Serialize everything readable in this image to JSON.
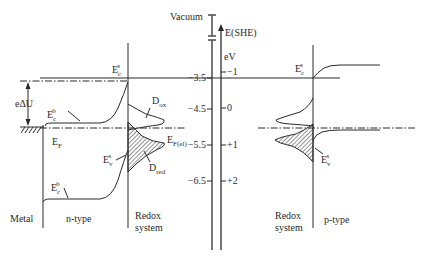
{
  "diagram": {
    "vacuum_axis": {
      "label": "Vacuum",
      "ticks": [
        {
          "label": "−3.5",
          "value": -3.5
        },
        {
          "label": "−4.5",
          "value": -4.5
        },
        {
          "label": "−5.5",
          "value": -5.5
        },
        {
          "label": "−6.5",
          "value": -6.5
        }
      ]
    },
    "she_axis": {
      "label": "E(SHE)",
      "unit": "eV",
      "ticks": [
        {
          "label": "−1",
          "value": -1
        },
        {
          "label": "0",
          "value": 0
        },
        {
          "label": "+1",
          "value": 1
        },
        {
          "label": "+2",
          "value": 2
        }
      ]
    },
    "left_panel": {
      "regions": {
        "metal": "Metal",
        "semiconductor": "n-type",
        "electrolyte_line1": "Redox",
        "electrolyte_line2": "system"
      },
      "labels": {
        "delta_u": "eΔU",
        "ec_bulk_top": {
          "main": "E",
          "sub": "c",
          "sup": "b"
        },
        "fermi": {
          "main": "E",
          "sub": "F"
        },
        "ec_surface": {
          "main": "E",
          "sub": "c",
          "sup": "s"
        },
        "ev_surface": {
          "main": "E",
          "sub": "v",
          "sup": "s"
        },
        "ec_bulk_bottom": {
          "main": "E",
          "sub": "c",
          "sup": "b"
        },
        "d_ox": {
          "main": "D",
          "sub": "ox"
        },
        "d_red": {
          "main": "D",
          "sub": "red"
        },
        "ef_el": {
          "main": "E",
          "sub": "F(el)"
        }
      }
    },
    "right_panel": {
      "regions": {
        "electrolyte_line1": "Redox",
        "electrolyte_line2": "system",
        "semiconductor": "p-type"
      },
      "labels": {
        "ec_surface": {
          "main": "E",
          "sub": "c",
          "sup": "s"
        },
        "ev_surface": {
          "main": "E",
          "sub": "v",
          "sup": "s"
        }
      }
    },
    "colors": {
      "line": "#2a2a2a",
      "axis": "#555555",
      "background": "#ffffff"
    }
  }
}
